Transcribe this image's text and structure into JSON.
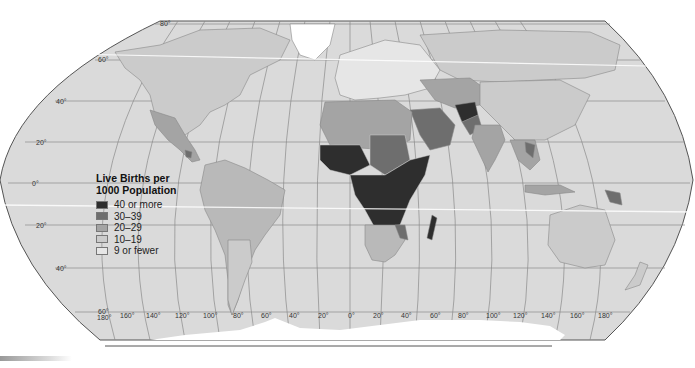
{
  "map": {
    "title": "Live Births per 1000 Population",
    "projection": "Robinson",
    "legend": {
      "title_line1": "Live Births per",
      "title_line2": "1000 Population",
      "items": [
        {
          "label": "40 or more",
          "color": "#2e2e2e"
        },
        {
          "label": "30–39",
          "color": "#6e6e6e"
        },
        {
          "label": "20–29",
          "color": "#a4a4a4"
        },
        {
          "label": "10–19",
          "color": "#cbcbcb"
        },
        {
          "label": "9 or fewer",
          "color": "#e6e6e6"
        }
      ]
    },
    "latitude_labels": [
      "80°",
      "60°",
      "40°",
      "20°",
      "0°",
      "20°",
      "40°",
      "60°"
    ],
    "longitude_labels": [
      "180°",
      "160°",
      "140°",
      "120°",
      "100°",
      "80°",
      "60°",
      "40°",
      "20°",
      "0°",
      "20°",
      "40°",
      "60°",
      "80°",
      "100°",
      "120°",
      "140°",
      "160°",
      "180°"
    ],
    "colors": {
      "ocean": "#d9d9d9",
      "land_default": "#cbcbcb",
      "grid": "#8a8a8a",
      "outline": "#555555"
    }
  }
}
